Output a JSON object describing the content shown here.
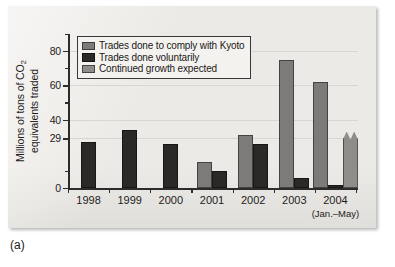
{
  "figure": {
    "caption": "(a)"
  },
  "chart_data": {
    "type": "bar",
    "title": "",
    "xlabel": "",
    "ylabel": "Millions of tons of CO2 equivalents traded",
    "ylabel_parts": {
      "line1_pre": "Millions of tons of CO",
      "line1_sub": "2",
      "line2": "equivalents traded"
    },
    "ylim": [
      0,
      90
    ],
    "yticks": [
      0,
      29,
      40,
      60,
      80
    ],
    "ytick_labels": [
      "0",
      "29",
      "40",
      "60",
      "80"
    ],
    "grid": true,
    "legend_position": "top-left",
    "categories": [
      "1998",
      "1999",
      "2000",
      "2001",
      "2002",
      "2003",
      "2004"
    ],
    "category_sublabels": [
      "",
      "",
      "",
      "",
      "",
      "",
      "(Jan.–May)"
    ],
    "series": [
      {
        "name": "Trades done to comply with Kyoto",
        "color": "#7c7b79",
        "values": [
          null,
          null,
          null,
          15,
          31,
          75,
          62
        ]
      },
      {
        "name": "Trades done voluntarily",
        "color": "#2a2927",
        "values": [
          27,
          34,
          26,
          10,
          26,
          6,
          2
        ]
      },
      {
        "name": "Continued growth expected",
        "color": "#8e8d8a",
        "values": [
          null,
          null,
          null,
          null,
          null,
          null,
          33
        ]
      }
    ],
    "annotations": [
      {
        "text": "jagged-top bar indicates projected continued growth",
        "category": "2004"
      }
    ]
  },
  "legend": {
    "items": [
      {
        "label": "Trades done to comply with Kyoto",
        "color": "#7c7b79"
      },
      {
        "label": "Trades done voluntarily",
        "color": "#2a2927"
      },
      {
        "label": "Continued growth expected",
        "color": "#8e8d8a"
      }
    ]
  }
}
